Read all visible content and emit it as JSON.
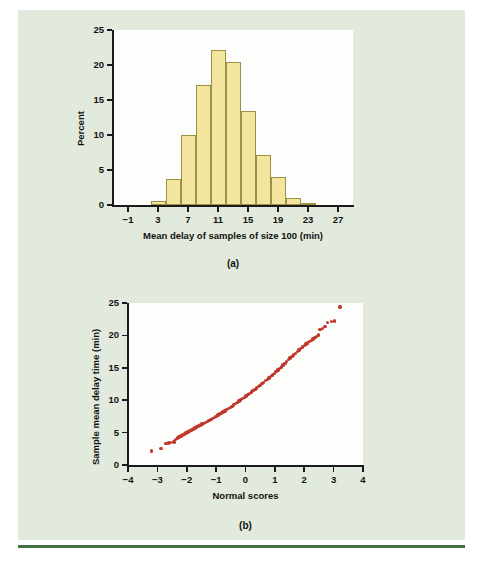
{
  "figure": {
    "background_color": "#e2eade",
    "rule_color": "#3f7244"
  },
  "panel_a": {
    "caption": "(a)",
    "chart_data": {
      "type": "bar",
      "title": "",
      "xlabel": "Mean delay of samples of size 100 (min)",
      "ylabel": "Percent",
      "xlim": [
        -3,
        29
      ],
      "ylim": [
        0,
        25
      ],
      "xticks": [
        -1,
        3,
        7,
        11,
        15,
        19,
        23,
        27
      ],
      "xtick_labels": [
        "−1",
        "3",
        "7",
        "11",
        "15",
        "19",
        "23",
        "27"
      ],
      "yticks": [
        0,
        5,
        10,
        15,
        20,
        25
      ],
      "ytick_labels": [
        "0",
        "5",
        "10",
        "15",
        "20",
        "25"
      ],
      "grid": false,
      "legend": "none",
      "bar_color": "#f3e49e",
      "bar_edge_color": "#9a9046",
      "bin_width": 2,
      "bin_starts": [
        2,
        4,
        6,
        8,
        10,
        12,
        14,
        16,
        18,
        20,
        22
      ],
      "categories": [
        "2–4",
        "4–6",
        "6–8",
        "8–10",
        "10–12",
        "12–14",
        "14–16",
        "16–18",
        "18–20",
        "20–22",
        "22–24"
      ],
      "values": [
        0.6,
        3.7,
        10.0,
        17.2,
        22.2,
        20.5,
        13.5,
        7.2,
        4.0,
        1.0,
        0.3
      ]
    }
  },
  "panel_b": {
    "caption": "(b)",
    "chart_data": {
      "type": "scatter",
      "title": "",
      "xlabel": "Normal scores",
      "ylabel": "Sample mean delay time (min)",
      "xlim": [
        -4,
        4
      ],
      "ylim": [
        0,
        25
      ],
      "xticks": [
        -4,
        -3,
        -2,
        -1,
        0,
        1,
        2,
        3,
        4
      ],
      "xtick_labels": [
        "−4",
        "−3",
        "−2",
        "−1",
        "0",
        "1",
        "2",
        "3",
        "4"
      ],
      "yticks": [
        0,
        5,
        10,
        15,
        20,
        25
      ],
      "ytick_labels": [
        "0",
        "5",
        "10",
        "15",
        "20",
        "25"
      ],
      "grid": false,
      "legend": "none",
      "point_color": "#c0372b",
      "points": [
        [
          -3.2,
          2.15
        ],
        [
          -2.88,
          2.55
        ],
        [
          -2.7,
          3.35
        ],
        [
          -2.62,
          3.4
        ],
        [
          -2.55,
          3.45
        ],
        [
          -2.44,
          3.55
        ],
        [
          -2.38,
          3.95
        ],
        [
          -2.32,
          4.15
        ],
        [
          -2.26,
          4.3
        ],
        [
          -2.2,
          4.45
        ],
        [
          -2.14,
          4.6
        ],
        [
          -2.08,
          4.8
        ],
        [
          -2.02,
          4.95
        ],
        [
          -1.96,
          5.1
        ],
        [
          -1.9,
          5.25
        ],
        [
          -1.84,
          5.4
        ],
        [
          -1.78,
          5.55
        ],
        [
          -1.72,
          5.7
        ],
        [
          -1.66,
          5.85
        ],
        [
          -1.6,
          6.0
        ],
        [
          -1.54,
          6.15
        ],
        [
          -1.48,
          6.3
        ],
        [
          -1.42,
          6.45
        ],
        [
          -1.36,
          6.6
        ],
        [
          -1.3,
          6.75
        ],
        [
          -1.24,
          6.9
        ],
        [
          -1.18,
          7.05
        ],
        [
          -1.12,
          7.2
        ],
        [
          -1.06,
          7.35
        ],
        [
          -1.0,
          7.5
        ],
        [
          -0.94,
          7.7
        ],
        [
          -0.88,
          7.85
        ],
        [
          -0.82,
          8.0
        ],
        [
          -0.76,
          8.2
        ],
        [
          -0.7,
          8.35
        ],
        [
          -0.64,
          8.55
        ],
        [
          -0.58,
          8.7
        ],
        [
          -0.52,
          8.9
        ],
        [
          -0.46,
          9.05
        ],
        [
          -0.4,
          9.25
        ],
        [
          -0.34,
          9.45
        ],
        [
          -0.28,
          9.65
        ],
        [
          -0.22,
          9.85
        ],
        [
          -0.16,
          10.05
        ],
        [
          -0.1,
          10.25
        ],
        [
          -0.04,
          10.45
        ],
        [
          0.02,
          10.65
        ],
        [
          0.08,
          10.85
        ],
        [
          0.14,
          11.05
        ],
        [
          0.2,
          11.25
        ],
        [
          0.26,
          11.45
        ],
        [
          0.32,
          11.65
        ],
        [
          0.38,
          11.9
        ],
        [
          0.44,
          12.1
        ],
        [
          0.5,
          12.3
        ],
        [
          0.56,
          12.55
        ],
        [
          0.62,
          12.75
        ],
        [
          0.68,
          13.0
        ],
        [
          0.74,
          13.2
        ],
        [
          0.8,
          13.45
        ],
        [
          0.86,
          13.7
        ],
        [
          0.92,
          13.9
        ],
        [
          0.98,
          14.15
        ],
        [
          1.04,
          14.4
        ],
        [
          1.1,
          14.65
        ],
        [
          1.16,
          14.9
        ],
        [
          1.22,
          15.15
        ],
        [
          1.28,
          15.45
        ],
        [
          1.34,
          15.7
        ],
        [
          1.4,
          16.0
        ],
        [
          1.46,
          16.25
        ],
        [
          1.52,
          16.5
        ],
        [
          1.58,
          16.75
        ],
        [
          1.64,
          17.0
        ],
        [
          1.7,
          17.25
        ],
        [
          1.76,
          17.5
        ],
        [
          1.82,
          17.75
        ],
        [
          1.88,
          18.0
        ],
        [
          1.94,
          18.2
        ],
        [
          2.0,
          18.45
        ],
        [
          2.06,
          18.65
        ],
        [
          2.12,
          18.85
        ],
        [
          2.18,
          19.05
        ],
        [
          2.24,
          19.25
        ],
        [
          2.3,
          19.45
        ],
        [
          2.36,
          19.65
        ],
        [
          2.42,
          19.85
        ],
        [
          2.48,
          20.05
        ],
        [
          2.54,
          20.9
        ],
        [
          2.62,
          21.1
        ],
        [
          2.7,
          21.35
        ],
        [
          2.8,
          22.0
        ],
        [
          2.92,
          22.15
        ],
        [
          3.02,
          22.25
        ],
        [
          3.22,
          24.4
        ]
      ]
    }
  }
}
